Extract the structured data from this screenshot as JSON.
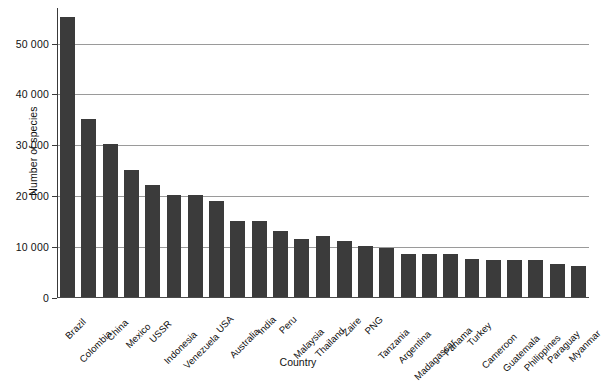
{
  "chart_data": {
    "type": "bar",
    "title": "",
    "xlabel": "Country",
    "ylabel": "Number of species",
    "ylim": [
      0,
      57000
    ],
    "grid": true,
    "legend": "none",
    "orientation": "vertical",
    "bar_color": "#3b3b3b",
    "categories": [
      "Brazil",
      "Colombia",
      "China",
      "Mexico",
      "USSR",
      "Indonesia",
      "Venezuela",
      "USA",
      "Australia",
      "India",
      "Peru",
      "Malaysia",
      "Thailand",
      "Zaire",
      "PNG",
      "Tanzania",
      "Argentina",
      "Madagascar",
      "Panama",
      "Turkey",
      "Cameroon",
      "Guatemala",
      "Philippines",
      "Paraguay",
      "Myanmar"
    ],
    "values": [
      55000,
      35000,
      30000,
      25000,
      22000,
      20000,
      20000,
      18800,
      15000,
      15000,
      13000,
      11500,
      12000,
      11000,
      10000,
      9700,
      8500,
      8500,
      8500,
      7500,
      7300,
      7300,
      7300,
      6500,
      6000
    ],
    "yticks": [
      {
        "value": 0,
        "label": "0"
      },
      {
        "value": 10000,
        "label": "10 000"
      },
      {
        "value": 20000,
        "label": "20 000"
      },
      {
        "value": 30000,
        "label": "30 000"
      },
      {
        "value": 40000,
        "label": "40 000"
      },
      {
        "value": 50000,
        "label": "50 000"
      }
    ]
  }
}
